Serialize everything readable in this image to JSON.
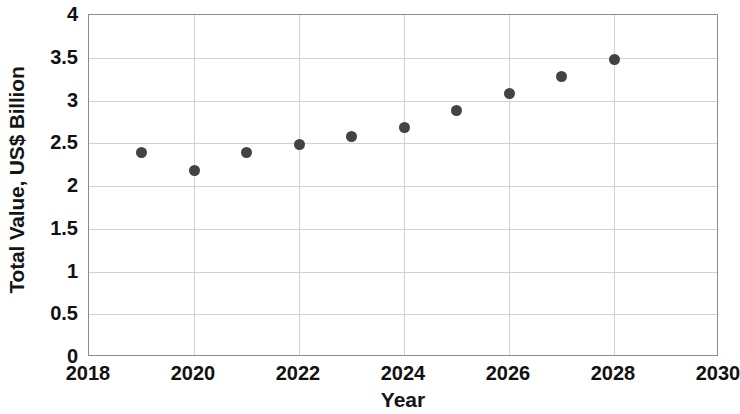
{
  "chart_data": {
    "type": "scatter",
    "title": "",
    "xlabel": "Year",
    "ylabel": "Total Value, US$ Billion",
    "xlim": [
      2018,
      2030
    ],
    "ylim": [
      0,
      4
    ],
    "xticks": [
      2018,
      2020,
      2022,
      2024,
      2026,
      2028,
      2030
    ],
    "xtick_labels": [
      "2018",
      "2020",
      "2022",
      "2024",
      "2026",
      "2028",
      "2030"
    ],
    "yticks": [
      0,
      0.5,
      1,
      1.5,
      2,
      2.5,
      3,
      3.5,
      4
    ],
    "ytick_labels": [
      "0",
      "0.5",
      "1",
      "1.5",
      "2",
      "2.5",
      "3",
      "3.5",
      "4"
    ],
    "grid": true,
    "grid_axes": "both",
    "legend": "none",
    "marker": "circle",
    "marker_color": "#434343",
    "grid_color": "#d2d2d2",
    "frame_color": "#8c8c8c",
    "background_color": "#ffffff",
    "x": [
      2019,
      2020,
      2021,
      2022,
      2023,
      2024,
      2025,
      2026,
      2027,
      2028
    ],
    "values": [
      2.39,
      2.18,
      2.39,
      2.48,
      2.58,
      2.68,
      2.88,
      3.08,
      3.28,
      3.48
    ],
    "points": [
      {
        "x": 2019,
        "y": 2.39
      },
      {
        "x": 2020,
        "y": 2.18
      },
      {
        "x": 2021,
        "y": 2.39
      },
      {
        "x": 2022,
        "y": 2.48
      },
      {
        "x": 2023,
        "y": 2.58
      },
      {
        "x": 2024,
        "y": 2.68
      },
      {
        "x": 2025,
        "y": 2.88
      },
      {
        "x": 2026,
        "y": 3.08
      },
      {
        "x": 2027,
        "y": 3.28
      },
      {
        "x": 2028,
        "y": 3.48
      }
    ],
    "gridlines_y": [
      0.5,
      1,
      1.5,
      2,
      2.5,
      3,
      3.5
    ],
    "gridlines_x": [
      2020,
      2022,
      2024,
      2026,
      2028
    ]
  }
}
